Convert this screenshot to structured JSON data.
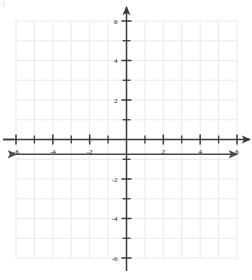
{
  "figure": {
    "corner_mark": ")",
    "background_color": "#ffffff",
    "grid_color": "#e9e9f0",
    "axis_color": "#3a3a3a",
    "line_color": "#4a4a4a",
    "label_color": "#1a1a1a"
  },
  "chart_data": {
    "type": "line",
    "title": "",
    "subtitle": "",
    "xlabel": "",
    "ylabel": "",
    "xlim": [
      -6,
      6
    ],
    "ylim": [
      -6,
      6
    ],
    "grid": true,
    "grid_step": 1,
    "legend": null,
    "legend_position": "none",
    "x_tick_labels": [
      "-6",
      "-4",
      "-2",
      "2",
      "4",
      "6"
    ],
    "x_tick_values": [
      -6,
      -4,
      -2,
      2,
      4,
      6
    ],
    "y_tick_labels": [
      "6",
      "4",
      "2",
      "-2",
      "-4",
      "-6"
    ],
    "y_tick_values": [
      6,
      4,
      2,
      -2,
      -4,
      -6
    ],
    "minor_tick_values_x": [
      -5,
      -3,
      -1,
      1,
      3,
      5
    ],
    "minor_tick_values_y": [
      5,
      3,
      1,
      -1,
      -3,
      -5
    ],
    "axes_arrows": true,
    "series": [
      {
        "name": "horizontal-line",
        "equation": "y = -0.75",
        "type": "line",
        "x": [
          -6,
          6
        ],
        "y": [
          -0.75,
          -0.75
        ],
        "arrow_start": true,
        "arrow_end": true,
        "color": "#4a4a4a",
        "width": 1.6
      }
    ]
  },
  "axes": {
    "x_axis_name": "x-axis",
    "y_axis_name": "y-axis",
    "origin_label": ""
  }
}
